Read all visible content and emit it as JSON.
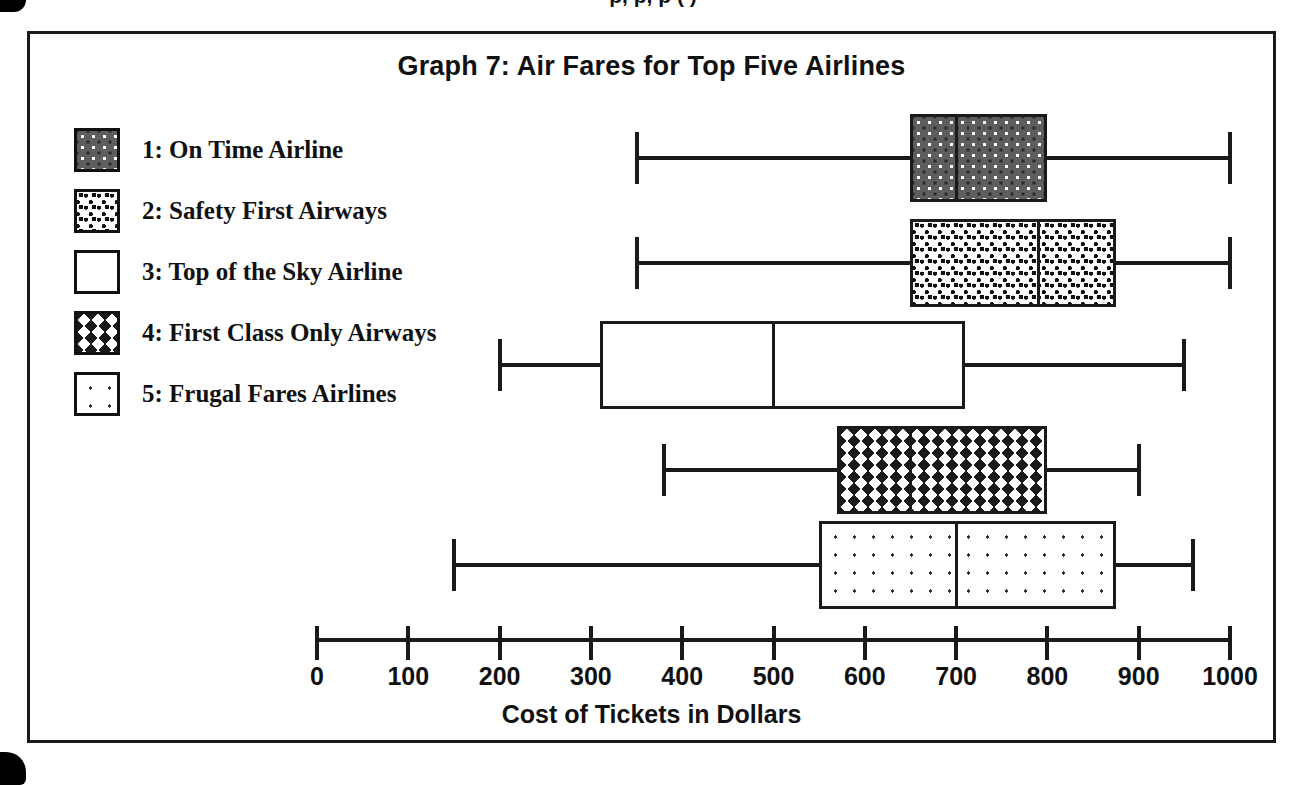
{
  "page": {
    "top_clipped_caption": "p,  p,  p (        )"
  },
  "chart": {
    "title": "Graph 7: Air Fares for Top Five Airlines",
    "xlabel": "Cost of Tickets in Dollars"
  },
  "legend": {
    "items": [
      {
        "key": "1",
        "label": "1: On Time Airline",
        "pattern": "pat-dark-dots"
      },
      {
        "key": "2",
        "label": "2: Safety First Airways",
        "pattern": "pat-speckle"
      },
      {
        "key": "3",
        "label": "3: Top of the Sky Airline",
        "pattern": "pat-plain"
      },
      {
        "key": "4",
        "label": "4: First Class Only Airways",
        "pattern": "pat-zigzag"
      },
      {
        "key": "5",
        "label": "5: Frugal Fares Airlines",
        "pattern": "pat-sparse-dots"
      }
    ]
  },
  "axis": {
    "min": 0,
    "max": 1000,
    "step": 100,
    "ticks": [
      0,
      100,
      200,
      300,
      400,
      500,
      600,
      700,
      800,
      900,
      1000
    ],
    "tick_labels": [
      "0",
      "100",
      "200",
      "300",
      "400",
      "500",
      "600",
      "700",
      "800",
      "900",
      "1000"
    ]
  },
  "chart_data": {
    "type": "box",
    "orientation": "horizontal",
    "title": "Graph 7: Air Fares for Top Five Airlines",
    "xlabel": "Cost of Tickets in Dollars",
    "ylabel": "",
    "xlim": [
      0,
      1000
    ],
    "xticks": [
      0,
      100,
      200,
      300,
      400,
      500,
      600,
      700,
      800,
      900,
      1000
    ],
    "grid": false,
    "legend_position": "upper-left",
    "categories": [
      "1: On Time Airline",
      "2: Safety First Airways",
      "3: Top of the Sky Airline",
      "4: First Class Only Airways",
      "5: Frugal Fares Airlines"
    ],
    "boxes": [
      {
        "name": "1: On Time Airline",
        "pattern": "dark-with-white-dots",
        "min": 350,
        "q1": 650,
        "median": 700,
        "q3": 800,
        "max": 1000
      },
      {
        "name": "2: Safety First Airways",
        "pattern": "dense-black-speckle",
        "min": 350,
        "q1": 650,
        "median": 790,
        "q3": 875,
        "max": 1000
      },
      {
        "name": "3: Top of the Sky Airline",
        "pattern": "plain-white",
        "min": 200,
        "q1": 310,
        "median": 500,
        "q3": 710,
        "max": 950
      },
      {
        "name": "4: First Class Only Airways",
        "pattern": "zigzag-lines",
        "min": 380,
        "q1": 570,
        "median": 650,
        "q3": 800,
        "max": 900
      },
      {
        "name": "5: Frugal Fares Airlines",
        "pattern": "sparse-light-dots",
        "min": 150,
        "q1": 550,
        "median": 700,
        "q3": 875,
        "max": 960
      }
    ]
  },
  "geometry": {
    "axis_x0_px": 317,
    "axis_x1000_px": 1230,
    "row_tops_px": [
      113,
      218,
      320,
      425,
      520
    ],
    "axis_line_y_px": 638,
    "axis_tick_top_px": 626,
    "axis_labels_y_px": 662,
    "axis_title_y_px": 700
  }
}
